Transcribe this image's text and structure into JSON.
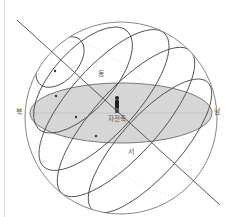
{
  "diagram": {
    "labels": {
      "north": "북",
      "south": "남",
      "east": "동",
      "west": "서",
      "axis": "자전축"
    },
    "elements": {
      "celestial_sphere": "천구",
      "horizon_plane": "지평면",
      "observer": "관측자",
      "rotation_axis": "자전축",
      "diurnal_circles_count": 5
    },
    "colors": {
      "line": "#4a4a4a",
      "sphere": "#6a6a6a",
      "horizon_fill": "#d4d4d4",
      "horizon_stroke": "#555555",
      "observer": "#222222",
      "faint": "#c8c8c8"
    }
  }
}
